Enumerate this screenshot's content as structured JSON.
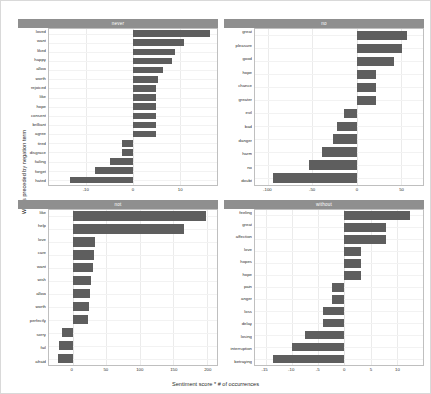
{
  "chart_data": {
    "type": "bar",
    "title": "",
    "xlabel": "Sentiment score * # of occurrences",
    "ylabel": "Words preceded by negation term",
    "orientation": "horizontal",
    "grid": true,
    "legend": false,
    "facets": [
      {
        "name": "never",
        "xlim": [
          -18,
          18
        ],
        "xticks": [
          -10,
          0,
          10
        ],
        "xticklabels": [
          "-10",
          "0",
          "10"
        ],
        "categories": [
          "loved",
          "want",
          "liked",
          "happy",
          "allow",
          "worth",
          "rejoiced",
          "like",
          "hope",
          "consent",
          "brilliant",
          "agree",
          "tired",
          "disgrace",
          "failing",
          "forget",
          "hated"
        ],
        "values": [
          16.5,
          11.0,
          9.0,
          8.4,
          6.5,
          5.4,
          5.0,
          5.0,
          5.0,
          5.0,
          5.0,
          5.0,
          -2.4,
          -2.4,
          -5.0,
          -8.1,
          -13.5
        ]
      },
      {
        "name": "no",
        "xlim": [
          -115,
          75
        ],
        "xticks": [
          -100,
          -50,
          0,
          50
        ],
        "xticklabels": [
          "-100",
          "-50",
          "0",
          "50"
        ],
        "categories": [
          "great",
          "pleasure",
          "good",
          "hope",
          "chance",
          "greater",
          "evil",
          "bad",
          "danger",
          "harm",
          "no",
          "doubt"
        ],
        "values": [
          57.0,
          51.0,
          42.0,
          22.0,
          22.0,
          22.0,
          -14.0,
          -22.0,
          -27.0,
          -39.0,
          -54.0,
          -95.0
        ]
      },
      {
        "name": "not",
        "xlim": [
          -35,
          215
        ],
        "xticks": [
          0,
          50,
          100,
          150,
          200
        ],
        "xticklabels": [
          "0",
          "50",
          "100",
          "150",
          "200"
        ],
        "categories": [
          "like",
          "help",
          "love",
          "care",
          "want",
          "wish",
          "allow",
          "worth",
          "perfectly",
          "sorry",
          "fail",
          "afraid"
        ],
        "values": [
          198.0,
          166.0,
          33.0,
          32.0,
          31.0,
          28.0,
          26.0,
          25.0,
          23.0,
          -16.0,
          -20.0,
          -22.0
        ]
      },
      {
        "name": "without",
        "xlim": [
          -17,
          15
        ],
        "xticks": [
          -15,
          -10,
          -5,
          0,
          5,
          10
        ],
        "xticklabels": [
          "-15",
          "-10",
          "-5",
          "0",
          "5",
          "10"
        ],
        "categories": [
          "feeling",
          "great",
          "affection",
          "love",
          "hopes",
          "hope",
          "pain",
          "anger",
          "loss",
          "delay",
          "losing",
          "interruption",
          "betraying"
        ],
        "values": [
          12.5,
          8.0,
          8.0,
          3.2,
          3.2,
          3.2,
          -2.4,
          -2.4,
          -4.0,
          -4.0,
          -7.5,
          -10.0,
          -13.5
        ]
      }
    ]
  }
}
